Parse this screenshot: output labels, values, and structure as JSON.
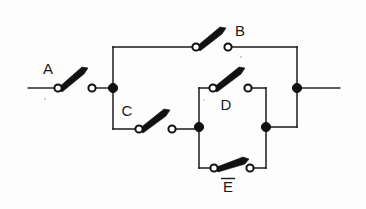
{
  "diagram": {
    "type": "switch-circuit-schematic",
    "line_color": "#1a1a1a",
    "background_color": "#fdfdfd",
    "terminal_fill": "#ffffff",
    "junction_fill": "#111111",
    "switches": [
      {
        "id": "A",
        "label": "A",
        "state": "open",
        "label_position": "above-left",
        "label_x": 48,
        "label_y": 74,
        "left_terminal": {
          "x": 58,
          "y": 88
        },
        "right_terminal": {
          "x": 92,
          "y": 88
        },
        "lever_tip": {
          "x": 86,
          "y": 70
        }
      },
      {
        "id": "B",
        "label": "B",
        "state": "open",
        "label_position": "above-right",
        "label_x": 228,
        "label_y": 36,
        "left_terminal": {
          "x": 196,
          "y": 47
        },
        "right_terminal": {
          "x": 228,
          "y": 47
        },
        "lever_tip": {
          "x": 224,
          "y": 29
        }
      },
      {
        "id": "C",
        "label": "C",
        "state": "open",
        "label_position": "above-left",
        "label_x": 127,
        "label_y": 116,
        "left_terminal": {
          "x": 139,
          "y": 129
        },
        "right_terminal": {
          "x": 172,
          "y": 129
        },
        "lever_tip": {
          "x": 168,
          "y": 111
        }
      },
      {
        "id": "D",
        "label": "D",
        "state": "open",
        "label_position": "below",
        "label_x": 226,
        "label_y": 107,
        "left_terminal": {
          "x": 213,
          "y": 88
        },
        "right_terminal": {
          "x": 248,
          "y": 88
        },
        "lever_tip": {
          "x": 244,
          "y": 70
        }
      },
      {
        "id": "E",
        "label": "E",
        "label_negated": true,
        "state": "open",
        "label_position": "below",
        "label_x": 228,
        "label_y": 192,
        "left_terminal": {
          "x": 214,
          "y": 168
        },
        "right_terminal": {
          "x": 250,
          "y": 168
        },
        "lever_tip": {
          "x": 247,
          "y": 159
        }
      }
    ],
    "junctions": [
      {
        "id": "left-main-node",
        "x": 113,
        "y": 88
      },
      {
        "id": "right-main-node",
        "x": 297,
        "y": 88
      },
      {
        "id": "inner-left-node",
        "x": 199,
        "y": 127
      },
      {
        "id": "inner-right-node",
        "x": 266,
        "y": 127
      }
    ],
    "terminals": [
      {
        "id": "left-lead-end",
        "x": 28,
        "y": 88
      },
      {
        "id": "right-lead-end",
        "x": 340,
        "y": 88
      }
    ]
  }
}
